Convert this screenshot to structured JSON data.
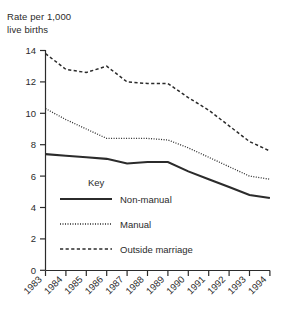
{
  "chart_data": {
    "type": "line",
    "xlabel": "",
    "ylabel": "Rate per 1,000 live births",
    "categories": [
      "1983",
      "1984",
      "1985",
      "1986",
      "1987",
      "1988",
      "1989",
      "1990",
      "1991",
      "1992",
      "1993",
      "1994"
    ],
    "x": [
      1983,
      1984,
      1985,
      1986,
      1987,
      1988,
      1989,
      1990,
      1991,
      1992,
      1993,
      1994
    ],
    "xlim": [
      1983,
      1994
    ],
    "ylim": [
      0,
      14
    ],
    "yticks": [
      0,
      2,
      4,
      6,
      8,
      10,
      12,
      14
    ],
    "grid": false,
    "legend_position": "inside-lower-left",
    "legend_title": "Key",
    "series": [
      {
        "name": "Non-manual",
        "style": "solid",
        "values": [
          7.4,
          7.3,
          7.2,
          7.1,
          6.8,
          6.9,
          6.9,
          6.3,
          5.8,
          5.3,
          4.8,
          4.6
        ]
      },
      {
        "name": "Manual",
        "style": "dotted",
        "values": [
          10.3,
          9.6,
          9.0,
          8.4,
          8.4,
          8.4,
          8.3,
          7.8,
          7.2,
          6.6,
          6.0,
          5.8
        ]
      },
      {
        "name": "Outside marriage",
        "style": "dashed",
        "values": [
          13.8,
          12.8,
          12.6,
          13.0,
          12.0,
          11.9,
          11.9,
          11.0,
          10.2,
          9.2,
          8.2,
          7.6
        ]
      }
    ]
  },
  "axis": {
    "y_title_line1": "Rate per 1,000",
    "y_title_line2": "live births",
    "y_tick_labels": [
      "14",
      "12",
      "10",
      "8",
      "6",
      "4",
      "2",
      "0"
    ],
    "x_tick_labels": [
      "1983",
      "1984",
      "1985",
      "1986",
      "1987",
      "1988",
      "1989",
      "1990",
      "1991",
      "1992",
      "1993",
      "1994"
    ]
  },
  "legend": {
    "title": "Key",
    "entries": [
      {
        "label": "Non-manual",
        "style": "solid"
      },
      {
        "label": "Manual",
        "style": "dotted"
      },
      {
        "label": "Outside marriage",
        "style": "dashed"
      }
    ]
  },
  "colors": {
    "line": "#2b2b2b",
    "axis": "#2b2b2b",
    "background": "#ffffff"
  }
}
